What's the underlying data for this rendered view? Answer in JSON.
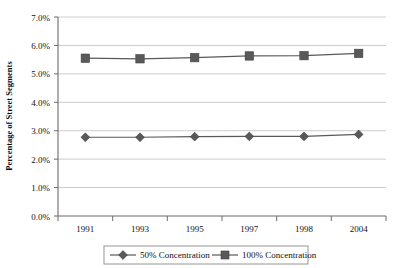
{
  "chart_data": {
    "type": "line",
    "title": "",
    "xlabel": "",
    "ylabel": "Percentage of Street Segments",
    "categories": [
      "1991",
      "1993",
      "1995",
      "1997",
      "1998",
      "2004"
    ],
    "ylim": [
      0,
      7
    ],
    "ytick_labels": [
      "0.0%",
      "1.0%",
      "2.0%",
      "3.0%",
      "4.0%",
      "5.0%",
      "6.0%",
      "7.0%"
    ],
    "ytick_values": [
      0,
      1,
      2,
      3,
      4,
      5,
      6,
      7
    ],
    "grid": true,
    "legend_position": "bottom",
    "series": [
      {
        "name": "50% Concentration",
        "marker": "diamond",
        "color": "#595959",
        "values": [
          2.77,
          2.77,
          2.79,
          2.8,
          2.8,
          2.87
        ]
      },
      {
        "name": "100% Concentration",
        "marker": "square",
        "color": "#595959",
        "values": [
          5.55,
          5.53,
          5.57,
          5.63,
          5.64,
          5.72
        ]
      }
    ]
  },
  "axis": {
    "y_title": "Percentage of Street Segments",
    "y_ticks": [
      "7.0%",
      "6.0%",
      "5.0%",
      "4.0%",
      "3.0%",
      "2.0%",
      "1.0%",
      "0.0%"
    ],
    "x_ticks": [
      "1991",
      "1993",
      "1995",
      "1997",
      "1998",
      "2004"
    ]
  },
  "legend": {
    "entries": [
      {
        "label": "50% Concentration",
        "marker": "diamond-marker"
      },
      {
        "label": "100% Concentration",
        "marker": "square-marker"
      }
    ]
  }
}
